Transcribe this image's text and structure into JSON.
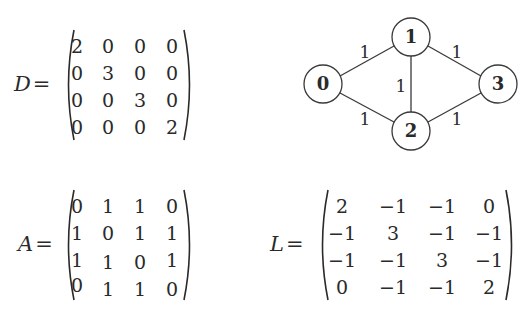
{
  "matrices": {
    "D": {
      "label": "D",
      "equals": "=",
      "rows": [
        [
          "2",
          "0",
          "0",
          "0"
        ],
        [
          "0",
          "3",
          "0",
          "0"
        ],
        [
          "0",
          "0",
          "3",
          "0"
        ],
        [
          "0",
          "0",
          "0",
          "2"
        ]
      ]
    },
    "A": {
      "label": "A",
      "equals": "=",
      "rows": [
        [
          "0",
          "1",
          "1",
          "0"
        ],
        [
          "1",
          "0",
          "1",
          "1"
        ],
        [
          "1",
          "1",
          "0",
          "1"
        ],
        [
          "0",
          "1",
          "1",
          "0"
        ]
      ]
    },
    "L": {
      "label": "L",
      "equals": "=",
      "rows": [
        [
          "2",
          "−1",
          "−1",
          "0"
        ],
        [
          "−1",
          "3",
          "−1",
          "−1"
        ],
        [
          "−1",
          "−1",
          "3",
          "−1"
        ],
        [
          "0",
          "−1",
          "−1",
          "2"
        ]
      ]
    }
  },
  "graph": {
    "nodes": [
      {
        "id": "0",
        "label": "0"
      },
      {
        "id": "1",
        "label": "1"
      },
      {
        "id": "2",
        "label": "2"
      },
      {
        "id": "3",
        "label": "3"
      }
    ],
    "edges": [
      {
        "from": "0",
        "to": "1",
        "weight": "1"
      },
      {
        "from": "0",
        "to": "2",
        "weight": "1"
      },
      {
        "from": "1",
        "to": "2",
        "weight": "1"
      },
      {
        "from": "1",
        "to": "3",
        "weight": "1"
      },
      {
        "from": "2",
        "to": "3",
        "weight": "1"
      }
    ],
    "colors": {
      "stroke": "#3a3a3a",
      "fill": "#ffffff",
      "text": "#2a2a2a"
    }
  }
}
